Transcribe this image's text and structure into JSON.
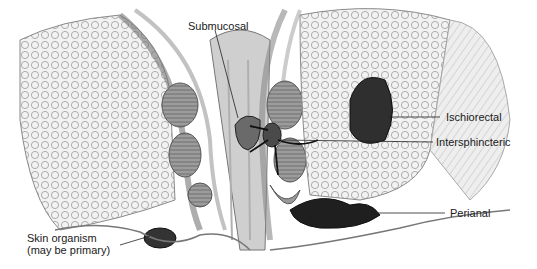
{
  "diagram": {
    "labels": {
      "submucosal": "Submucosal",
      "ischiorectal": "Ischiorectal",
      "intersphincteric": "Intersphincteric",
      "perianal": "Perianal",
      "skin_organism_line1": "Skin organism",
      "skin_organism_line2": "(may be primary)"
    },
    "colors": {
      "background": "#ffffff",
      "tissue_light": "#d9d9d9",
      "tissue_mid": "#a6a6a6",
      "tissue_dark": "#3a3a3a",
      "line": "#222222"
    }
  }
}
